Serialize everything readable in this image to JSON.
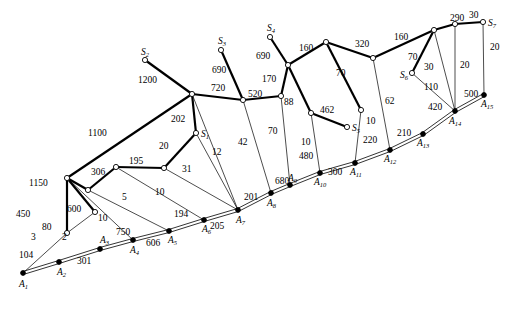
{
  "figure": {
    "type": "network-graph",
    "background_color": "#ffffff",
    "line_color": "#000000",
    "node_open_fill": "#ffffff",
    "node_filled_fill": "#000000"
  },
  "nodes": {
    "sources": [
      {
        "id": "S1",
        "label": "S",
        "sub": "1",
        "x": 196,
        "y": 133,
        "style": "open"
      },
      {
        "id": "S2",
        "label": "S",
        "sub": "2",
        "x": 145,
        "y": 60,
        "style": "open"
      },
      {
        "id": "S3",
        "label": "S",
        "sub": "3",
        "x": 221,
        "y": 50,
        "style": "open"
      },
      {
        "id": "S4",
        "label": "S",
        "sub": "4",
        "x": 270,
        "y": 37,
        "style": "open"
      },
      {
        "id": "S5",
        "label": "S",
        "sub": "5",
        "x": 347,
        "y": 127,
        "style": "open"
      },
      {
        "id": "S6",
        "label": "S",
        "sub": "6",
        "x": 412,
        "y": 73,
        "style": "open"
      },
      {
        "id": "S7",
        "label": "S",
        "sub": "7",
        "x": 483,
        "y": 22,
        "style": "open"
      }
    ],
    "terminals": [
      {
        "id": "A1",
        "label": "A",
        "sub": "1",
        "x": 23,
        "y": 273,
        "style": "filled"
      },
      {
        "id": "A2",
        "label": "A",
        "sub": "2",
        "x": 59,
        "y": 262,
        "style": "filled"
      },
      {
        "id": "A3",
        "label": "A",
        "sub": "3",
        "x": 100,
        "y": 249,
        "style": "filled"
      },
      {
        "id": "A4",
        "label": "A",
        "sub": "4",
        "x": 133,
        "y": 240,
        "style": "filled"
      },
      {
        "id": "A5",
        "label": "A",
        "sub": "5",
        "x": 169,
        "y": 231,
        "style": "filled"
      },
      {
        "id": "A6",
        "label": "A",
        "sub": "6",
        "x": 204,
        "y": 220,
        "style": "filled"
      },
      {
        "id": "A7",
        "label": "A",
        "sub": "7",
        "x": 238,
        "y": 210,
        "style": "filled"
      },
      {
        "id": "A8",
        "label": "A",
        "sub": "8",
        "x": 271,
        "y": 193,
        "style": "filled"
      },
      {
        "id": "A9",
        "label": "A",
        "sub": "9",
        "x": 290,
        "y": 185,
        "style": "filled"
      },
      {
        "id": "A10",
        "label": "A",
        "sub": "10",
        "x": 320,
        "y": 173,
        "style": "filled"
      },
      {
        "id": "A11",
        "label": "A",
        "sub": "11",
        "x": 355,
        "y": 163,
        "style": "filled"
      },
      {
        "id": "A12",
        "label": "A",
        "sub": "12",
        "x": 390,
        "y": 150,
        "style": "filled"
      },
      {
        "id": "A13",
        "label": "A",
        "sub": "13",
        "x": 423,
        "y": 134,
        "style": "filled"
      },
      {
        "id": "A14",
        "label": "A",
        "sub": "14",
        "x": 455,
        "y": 111,
        "style": "filled"
      },
      {
        "id": "A15",
        "label": "A",
        "sub": "15",
        "x": 484,
        "y": 95,
        "style": "filled"
      }
    ],
    "junctions": [
      {
        "id": "J1",
        "x": 67,
        "y": 233,
        "style": "open"
      },
      {
        "id": "J2",
        "x": 67,
        "y": 178,
        "style": "open"
      },
      {
        "id": "J3",
        "x": 95,
        "y": 212,
        "style": "open"
      },
      {
        "id": "J4",
        "x": 88,
        "y": 190,
        "style": "open"
      },
      {
        "id": "J5",
        "x": 116,
        "y": 167,
        "style": "open"
      },
      {
        "id": "J6",
        "x": 164,
        "y": 168,
        "style": "open"
      },
      {
        "id": "J7",
        "x": 192,
        "y": 94,
        "style": "open"
      },
      {
        "id": "J8",
        "x": 243,
        "y": 100,
        "style": "open"
      },
      {
        "id": "J9",
        "x": 281,
        "y": 96,
        "style": "open"
      },
      {
        "id": "J10",
        "x": 288,
        "y": 65,
        "style": "open"
      },
      {
        "id": "J11",
        "x": 311,
        "y": 113,
        "style": "open"
      },
      {
        "id": "J12",
        "x": 326,
        "y": 42,
        "style": "open"
      },
      {
        "id": "J13",
        "x": 361,
        "y": 110,
        "style": "open"
      },
      {
        "id": "J14",
        "x": 373,
        "y": 58,
        "style": "open"
      },
      {
        "id": "J15",
        "x": 434,
        "y": 30,
        "style": "open"
      },
      {
        "id": "J16",
        "x": 455,
        "y": 24,
        "style": "open"
      }
    ]
  },
  "edges": [
    {
      "from": "A1",
      "to": "A2",
      "weight": "104",
      "style": "double"
    },
    {
      "from": "A2",
      "to": "A3",
      "weight": "301",
      "style": "double"
    },
    {
      "from": "A3",
      "to": "A4",
      "weight": "750",
      "style": "double"
    },
    {
      "from": "A4",
      "to": "A5",
      "weight": "606",
      "style": "double"
    },
    {
      "from": "A5",
      "to": "A6",
      "weight": "194",
      "style": "double"
    },
    {
      "from": "A6",
      "to": "A7",
      "weight": "205",
      "style": "double"
    },
    {
      "from": "A7",
      "to": "A8",
      "weight": "201",
      "style": "double"
    },
    {
      "from": "A8",
      "to": "A9",
      "weight": "680",
      "style": "double"
    },
    {
      "from": "A9",
      "to": "A10",
      "weight": "480",
      "style": "double"
    },
    {
      "from": "A10",
      "to": "A11",
      "weight": "300",
      "style": "double"
    },
    {
      "from": "A11",
      "to": "A12",
      "weight": "220",
      "style": "double"
    },
    {
      "from": "A12",
      "to": "A13",
      "weight": "210",
      "style": "double"
    },
    {
      "from": "A13",
      "to": "A14",
      "weight": "420",
      "style": "double"
    },
    {
      "from": "A14",
      "to": "A15",
      "weight": "500",
      "style": "double"
    },
    {
      "from": "A1",
      "to": "J1",
      "weight": "3",
      "style": "thin"
    },
    {
      "from": "J1",
      "to": "J2",
      "weight": "450",
      "style": "thick"
    },
    {
      "from": "J1",
      "to": "J3",
      "weight": "2",
      "style": "thin"
    },
    {
      "from": "J2",
      "to": "J3",
      "weight": "80",
      "style": "thick"
    },
    {
      "from": "J2",
      "to": "A4",
      "weight": "600",
      "style": "thin"
    },
    {
      "from": "J2",
      "to": "J7",
      "weight": "1100",
      "style": "thick"
    },
    {
      "from": "J2",
      "to": "J4",
      "weight": "1150",
      "style": "thick"
    },
    {
      "from": "J4",
      "to": "J5",
      "weight": "306",
      "style": "thick"
    },
    {
      "from": "J4",
      "to": "A5",
      "weight": "10",
      "style": "thin"
    },
    {
      "from": "J5",
      "to": "J6",
      "weight": "195",
      "style": "thick"
    },
    {
      "from": "J5",
      "to": "A6",
      "weight": "5",
      "style": "thin"
    },
    {
      "from": "J6",
      "to": "S1",
      "weight": "20",
      "style": "thick"
    },
    {
      "from": "J6",
      "to": "A7",
      "weight": "10",
      "style": "thin"
    },
    {
      "from": "S1",
      "to": "J7",
      "weight": "202",
      "style": "thick"
    },
    {
      "from": "S1",
      "to": "A7",
      "weight": "31",
      "style": "thin"
    },
    {
      "from": "J7",
      "to": "A7",
      "weight": "12",
      "style": "thin"
    },
    {
      "from": "J7",
      "to": "S2",
      "weight": "1200",
      "style": "thick"
    },
    {
      "from": "J7",
      "to": "J8",
      "weight": "720",
      "style": "thick"
    },
    {
      "from": "J8",
      "to": "S3",
      "weight": "690",
      "style": "thick"
    },
    {
      "from": "J8",
      "to": "A8",
      "weight": "42",
      "style": "thin"
    },
    {
      "from": "J8",
      "to": "J9",
      "weight": "520",
      "style": "thick"
    },
    {
      "from": "J9",
      "to": "J10",
      "weight": "170",
      "style": "thick"
    },
    {
      "from": "J9",
      "to": "A9",
      "weight": "70",
      "style": "thin"
    },
    {
      "from": "J10",
      "to": "S4",
      "weight": "690",
      "style": "thick"
    },
    {
      "from": "J10",
      "to": "J11",
      "weight": "88",
      "style": "thick"
    },
    {
      "from": "J10",
      "to": "J12",
      "weight": "160",
      "style": "thick"
    },
    {
      "from": "J11",
      "to": "S5",
      "weight": "462",
      "style": "thick"
    },
    {
      "from": "J11",
      "to": "A10",
      "weight": "10",
      "style": "thin"
    },
    {
      "from": "J12",
      "to": "J13",
      "weight": "70",
      "style": "thick"
    },
    {
      "from": "J12",
      "to": "J14",
      "weight": "320",
      "style": "thick"
    },
    {
      "from": "J13",
      "to": "A11",
      "weight": "10",
      "style": "thin"
    },
    {
      "from": "J14",
      "to": "A12",
      "weight": "62",
      "style": "thin"
    },
    {
      "from": "J14",
      "to": "J15",
      "weight": "160",
      "style": "thick"
    },
    {
      "from": "J15",
      "to": "S6",
      "weight": "70",
      "style": "thick"
    },
    {
      "from": "J15",
      "to": "J16",
      "weight": "290",
      "style": "thick"
    },
    {
      "from": "J15",
      "to": "A14",
      "weight": "30",
      "style": "thin"
    },
    {
      "from": "S6",
      "to": "A14",
      "weight": "110",
      "style": "thin"
    },
    {
      "from": "J16",
      "to": "S7",
      "weight": "30",
      "style": "thick"
    },
    {
      "from": "J16",
      "to": "A14",
      "weight": "20",
      "style": "thin"
    },
    {
      "from": "S7",
      "to": "A15",
      "weight": "20",
      "style": "thin"
    }
  ],
  "weight_label_positions": [
    {
      "text": "104",
      "x": 19,
      "y": 258
    },
    {
      "text": "301",
      "x": 77,
      "y": 264
    },
    {
      "text": "750",
      "x": 116,
      "y": 235
    },
    {
      "text": "606",
      "x": 146,
      "y": 246
    },
    {
      "text": "194",
      "x": 174,
      "y": 217
    },
    {
      "text": "205",
      "x": 210,
      "y": 229
    },
    {
      "text": "201",
      "x": 244,
      "y": 200
    },
    {
      "text": "680",
      "x": 275,
      "y": 184
    },
    {
      "text": "480",
      "x": 299,
      "y": 159
    },
    {
      "text": "300",
      "x": 328,
      "y": 175
    },
    {
      "text": "220",
      "x": 363,
      "y": 143
    },
    {
      "text": "210",
      "x": 397,
      "y": 136
    },
    {
      "text": "420",
      "x": 428,
      "y": 110
    },
    {
      "text": "500",
      "x": 464,
      "y": 97
    },
    {
      "text": "3",
      "x": 31,
      "y": 240
    },
    {
      "text": "450",
      "x": 16,
      "y": 217
    },
    {
      "text": "2",
      "x": 62,
      "y": 240
    },
    {
      "text": "80",
      "x": 42,
      "y": 230
    },
    {
      "text": "600",
      "x": 67,
      "y": 212
    },
    {
      "text": "1100",
      "x": 88,
      "y": 136
    },
    {
      "text": "1150",
      "x": 29,
      "y": 186
    },
    {
      "text": "306",
      "x": 91,
      "y": 175
    },
    {
      "text": "10",
      "x": 98,
      "y": 221
    },
    {
      "text": "195",
      "x": 129,
      "y": 164
    },
    {
      "text": "5",
      "x": 122,
      "y": 200
    },
    {
      "text": "20",
      "x": 159,
      "y": 149
    },
    {
      "text": "10",
      "x": 155,
      "y": 195
    },
    {
      "text": "202",
      "x": 171,
      "y": 122
    },
    {
      "text": "31",
      "x": 182,
      "y": 172
    },
    {
      "text": "12",
      "x": 212,
      "y": 155
    },
    {
      "text": "1200",
      "x": 138,
      "y": 83
    },
    {
      "text": "720",
      "x": 211,
      "y": 91
    },
    {
      "text": "690",
      "x": 212,
      "y": 73
    },
    {
      "text": "42",
      "x": 238,
      "y": 145
    },
    {
      "text": "520",
      "x": 248,
      "y": 97
    },
    {
      "text": "170",
      "x": 262,
      "y": 82
    },
    {
      "text": "70",
      "x": 268,
      "y": 134
    },
    {
      "text": "690",
      "x": 256,
      "y": 59
    },
    {
      "text": "88",
      "x": 284,
      "y": 105
    },
    {
      "text": "160",
      "x": 299,
      "y": 51
    },
    {
      "text": "462",
      "x": 320,
      "y": 113
    },
    {
      "text": "10",
      "x": 301,
      "y": 145
    },
    {
      "text": "70",
      "x": 336,
      "y": 76
    },
    {
      "text": "320",
      "x": 355,
      "y": 47
    },
    {
      "text": "10",
      "x": 366,
      "y": 124
    },
    {
      "text": "62",
      "x": 385,
      "y": 104
    },
    {
      "text": "160",
      "x": 394,
      "y": 40
    },
    {
      "text": "70",
      "x": 408,
      "y": 60
    },
    {
      "text": "290",
      "x": 450,
      "y": 21
    },
    {
      "text": "30",
      "x": 424,
      "y": 70
    },
    {
      "text": "110",
      "x": 424,
      "y": 90
    },
    {
      "text": "30",
      "x": 469,
      "y": 18
    },
    {
      "text": "20",
      "x": 460,
      "y": 68
    },
    {
      "text": "20",
      "x": 490,
      "y": 50
    }
  ]
}
